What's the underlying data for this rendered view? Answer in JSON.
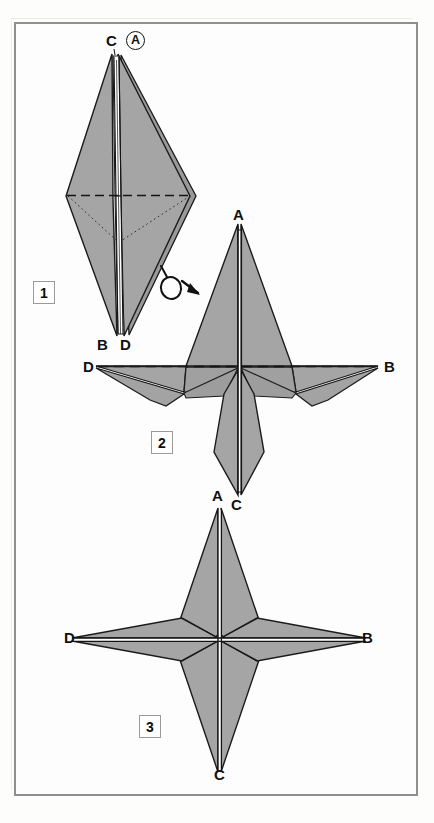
{
  "document": {
    "kind": "origami-folding-diagram",
    "title": "Four-pointed star origami fold sequence",
    "background_color": "#fdfdfd",
    "frame_color": "#8d8f91"
  },
  "palette": {
    "paper_front_fill": "#a3a3a3",
    "paper_shade_fill": "#9a9a9a",
    "paper_back_fill": "#ffffff",
    "outline": "#1b1b1b",
    "crease_valley": "#151515",
    "crease_hidden": "#2a2a2a",
    "label_color": "#111111"
  },
  "steps": [
    {
      "number": "1",
      "box_label": "1",
      "description": "Narrow kite-shaped preliminary form, point A behind C at the top, points B and D at the bottom.",
      "point_labels": [
        {
          "text": "C",
          "x": 110,
          "y": 38
        },
        {
          "text": "A",
          "x": 135,
          "y": 38,
          "circled": true
        },
        {
          "text": "B",
          "x": 101,
          "y": 340
        },
        {
          "text": "D",
          "x": 123,
          "y": 340
        }
      ],
      "creases": {
        "horizontal_dashed": "valley fold across the widest part",
        "diagonal_dotted": "hidden edges behind the front layer"
      }
    },
    {
      "number": "2",
      "box_label": "2",
      "description": "Model after turning over and swinging the flaps out; A points up, C points down, D to the left and B to the right.",
      "point_labels": [
        {
          "text": "A",
          "x": 234,
          "y": 211
        },
        {
          "text": "D",
          "x": 86,
          "y": 367
        },
        {
          "text": "B",
          "x": 385,
          "y": 367
        },
        {
          "text": "C",
          "x": 233,
          "y": 508
        }
      ],
      "creases": {
        "horizontal_dashed": "valley fold along the D–B axis"
      }
    },
    {
      "number": "3",
      "box_label": "3",
      "description": "Completed symmetric four-pointed star with points A (top), B (right), C (bottom) and D (left).",
      "point_labels": [
        {
          "text": "A",
          "x": 213,
          "y": 492
        },
        {
          "text": "D",
          "x": 67,
          "y": 638
        },
        {
          "text": "B",
          "x": 362,
          "y": 638
        },
        {
          "text": "C",
          "x": 215,
          "y": 774
        }
      ]
    }
  ],
  "symbols": [
    {
      "name": "turn-over-arrow",
      "meaning": "Turn the model over",
      "x": 160,
      "y": 268,
      "between_steps": "1 to 2"
    }
  ]
}
